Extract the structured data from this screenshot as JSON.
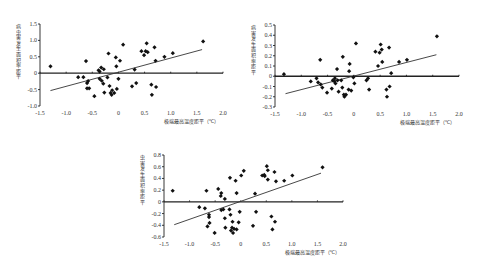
{
  "chart_data": [
    {
      "id": "chart-1",
      "type": "scatter",
      "title": "",
      "ylabel": "病虫害发生面积率距平",
      "xlabel": "极端最高温度距平（℃）",
      "xlim": [
        -1.5,
        2.0
      ],
      "ylim": [
        -1.0,
        1.5
      ],
      "xticks": [
        -1.5,
        -1.0,
        -0.5,
        0,
        0.5,
        1.0,
        1.5,
        2.0
      ],
      "xtick_labels": [
        "-1.5",
        "-1.0",
        "-0.5",
        "0",
        "0.5",
        "1.0",
        "1.5",
        "2.0"
      ],
      "yticks": [
        -1.0,
        -0.5,
        0,
        0.5,
        1.0,
        1.5
      ],
      "ytick_labels": [
        "-1.0",
        "-0.5",
        "0",
        "0.5",
        "1.0",
        "1.5"
      ],
      "grid": false,
      "legend": "none",
      "layout": {
        "left": 40,
        "top": 24,
        "width": 183,
        "height": 82
      },
      "trendline": {
        "x": [
          -1.3,
          1.6
        ],
        "y": [
          -0.53,
          0.72
        ]
      },
      "points": [
        [
          -1.3,
          0.21
        ],
        [
          -0.62,
          0.37
        ],
        [
          -0.77,
          -0.12
        ],
        [
          -0.67,
          -0.12
        ],
        [
          -0.58,
          -0.24
        ],
        [
          -0.6,
          -0.3
        ],
        [
          -0.6,
          -0.46
        ],
        [
          -0.56,
          -0.46
        ],
        [
          -0.46,
          -0.7
        ],
        [
          -0.38,
          0.09
        ],
        [
          -0.33,
          0.17
        ],
        [
          -0.36,
          0.05
        ],
        [
          -0.28,
          0.12
        ],
        [
          -0.36,
          -0.17
        ],
        [
          -0.32,
          -0.23
        ],
        [
          -0.29,
          -0.32
        ],
        [
          -0.27,
          -0.59
        ],
        [
          -0.21,
          -0.13
        ],
        [
          -0.19,
          0.6
        ],
        [
          -0.17,
          -0.39
        ],
        [
          -0.15,
          -0.6
        ],
        [
          -0.13,
          -0.66
        ],
        [
          -0.12,
          -0.52
        ],
        [
          -0.08,
          -0.6
        ],
        [
          -0.05,
          0.48
        ],
        [
          -0.04,
          0.21
        ],
        [
          -0.03,
          -0.48
        ],
        [
          0.0,
          -0.17
        ],
        [
          0.03,
          0.38
        ],
        [
          0.09,
          0.87
        ],
        [
          0.26,
          -0.4
        ],
        [
          0.31,
          0.11
        ],
        [
          0.34,
          -0.3
        ],
        [
          0.44,
          0.67
        ],
        [
          0.49,
          0.55
        ],
        [
          0.52,
          0.67
        ],
        [
          0.54,
          0.91
        ],
        [
          0.56,
          0.64
        ],
        [
          0.63,
          -0.35
        ],
        [
          0.64,
          -0.66
        ],
        [
          0.69,
          0.79
        ],
        [
          0.71,
          0.38
        ],
        [
          0.72,
          -0.42
        ],
        [
          0.88,
          0.5
        ],
        [
          1.04,
          0.61
        ],
        [
          1.62,
          0.97
        ]
      ]
    },
    {
      "id": "chart-2",
      "type": "scatter",
      "title": "",
      "ylabel": "病害发生面积率距平",
      "xlabel": "极端最高温度距平（℃）",
      "xlim": [
        -1.5,
        2.0
      ],
      "ylim": [
        -0.3,
        0.5
      ],
      "xticks": [
        -1.5,
        -1.0,
        -0.5,
        0,
        0.5,
        1.0,
        1.5,
        2.0
      ],
      "xtick_labels": [
        "-1.5",
        "-1.0",
        "-0.5",
        "0",
        "0.5",
        "1.0",
        "1.5",
        "2.0"
      ],
      "yticks": [
        -0.3,
        -0.2,
        -0.1,
        0,
        0.1,
        0.2,
        0.3,
        0.4,
        0.5
      ],
      "ytick_labels": [
        "-0.3",
        "-0.2",
        "-0.1",
        "0",
        "0.1",
        "0.2",
        "0.3",
        "0.4",
        "0.5"
      ],
      "grid": false,
      "legend": "none",
      "layout": {
        "left": 275,
        "top": 25,
        "width": 184,
        "height": 82
      },
      "trendline": {
        "x": [
          -1.3,
          1.57
        ],
        "y": [
          -0.17,
          0.21
        ]
      },
      "points": [
        [
          -1.33,
          0.02
        ],
        [
          -0.82,
          -0.05
        ],
        [
          -0.71,
          -0.02
        ],
        [
          -0.68,
          -0.06
        ],
        [
          -0.64,
          0.16
        ],
        [
          -0.63,
          -0.08
        ],
        [
          -0.6,
          -0.11
        ],
        [
          -0.51,
          -0.16
        ],
        [
          -0.42,
          -0.12
        ],
        [
          -0.4,
          -0.04
        ],
        [
          -0.37,
          -0.05
        ],
        [
          -0.36,
          -0.02
        ],
        [
          -0.35,
          -0.07
        ],
        [
          -0.32,
          0.07
        ],
        [
          -0.31,
          -0.04
        ],
        [
          -0.29,
          -0.15
        ],
        [
          -0.24,
          -0.04
        ],
        [
          -0.22,
          -0.11
        ],
        [
          -0.21,
          0.19
        ],
        [
          -0.19,
          -0.18
        ],
        [
          -0.18,
          -0.2
        ],
        [
          -0.15,
          -0.18
        ],
        [
          -0.1,
          -0.13
        ],
        [
          -0.09,
          0.05
        ],
        [
          -0.08,
          0.12
        ],
        [
          -0.05,
          -0.14
        ],
        [
          -0.01,
          -0.01
        ],
        [
          0.01,
          -0.07
        ],
        [
          0.04,
          0.32
        ],
        [
          0.24,
          -0.04
        ],
        [
          0.27,
          -0.02
        ],
        [
          0.29,
          -0.13
        ],
        [
          0.41,
          0.24
        ],
        [
          0.46,
          0.1
        ],
        [
          0.49,
          0.23
        ],
        [
          0.51,
          0.31
        ],
        [
          0.53,
          0.26
        ],
        [
          0.54,
          0.14
        ],
        [
          0.62,
          -0.13
        ],
        [
          0.63,
          -0.2
        ],
        [
          0.67,
          0.28
        ],
        [
          0.68,
          -0.1
        ],
        [
          0.71,
          0.03
        ],
        [
          0.86,
          0.14
        ],
        [
          1.01,
          0.16
        ],
        [
          1.58,
          0.39
        ]
      ]
    },
    {
      "id": "chart-3",
      "type": "scatter",
      "title": "",
      "ylabel": "虫害发生面积率距平",
      "xlabel": "极端最高温度距平（℃）",
      "xlim": [
        -1.5,
        2.0
      ],
      "ylim": [
        -0.6,
        0.8
      ],
      "xticks": [
        -1.5,
        -1.0,
        -0.5,
        0,
        0.5,
        1.0,
        1.5,
        2.0
      ],
      "xtick_labels": [
        "-1.5",
        "-1.0",
        "-0.5",
        "0",
        "0.5",
        "1.0",
        "1.5",
        "2.0"
      ],
      "yticks": [
        -0.6,
        -0.4,
        -0.2,
        0,
        0.2,
        0.4,
        0.6,
        0.8
      ],
      "ytick_labels": [
        "-0.6",
        "-0.4",
        "-0.2",
        "0",
        "0.2",
        "0.4",
        "0.6",
        "0.8"
      ],
      "grid": false,
      "legend": "none",
      "layout": {
        "left": 164,
        "top": 155,
        "width": 179,
        "height": 82
      },
      "trendline": {
        "x": [
          -1.3,
          1.57
        ],
        "y": [
          -0.39,
          0.49
        ]
      },
      "points": [
        [
          -1.33,
          0.19
        ],
        [
          -0.81,
          -0.09
        ],
        [
          -0.7,
          -0.11
        ],
        [
          -0.67,
          0.19
        ],
        [
          -0.65,
          -0.42
        ],
        [
          -0.62,
          -0.26
        ],
        [
          -0.62,
          -0.22
        ],
        [
          -0.61,
          -0.36
        ],
        [
          -0.51,
          -0.53
        ],
        [
          -0.44,
          0.22
        ],
        [
          -0.39,
          0.1
        ],
        [
          -0.38,
          0.15
        ],
        [
          -0.38,
          -0.14
        ],
        [
          -0.34,
          -0.13
        ],
        [
          -0.31,
          0.05
        ],
        [
          -0.31,
          -0.28
        ],
        [
          -0.3,
          -0.44
        ],
        [
          -0.22,
          -0.13
        ],
        [
          -0.21,
          0.41
        ],
        [
          -0.2,
          -0.22
        ],
        [
          -0.19,
          -0.49
        ],
        [
          -0.17,
          -0.44
        ],
        [
          -0.16,
          -0.34
        ],
        [
          -0.15,
          -0.53
        ],
        [
          -0.13,
          -0.46
        ],
        [
          -0.1,
          0.36
        ],
        [
          -0.08,
          0.15
        ],
        [
          -0.08,
          -0.47
        ],
        [
          -0.04,
          -0.35
        ],
        [
          -0.02,
          -0.17
        ],
        [
          0.01,
          0.45
        ],
        [
          0.06,
          0.53
        ],
        [
          0.24,
          -0.41
        ],
        [
          0.28,
          0.14
        ],
        [
          0.3,
          -0.17
        ],
        [
          0.42,
          0.45
        ],
        [
          0.46,
          0.46
        ],
        [
          0.47,
          0.44
        ],
        [
          0.51,
          0.61
        ],
        [
          0.53,
          0.54
        ],
        [
          0.53,
          0.38
        ],
        [
          0.6,
          -0.25
        ],
        [
          0.62,
          -0.47
        ],
        [
          0.66,
          0.51
        ],
        [
          0.67,
          -0.34
        ],
        [
          0.69,
          0.35
        ],
        [
          0.85,
          0.36
        ],
        [
          1.01,
          0.45
        ],
        [
          1.6,
          0.59
        ]
      ]
    }
  ]
}
